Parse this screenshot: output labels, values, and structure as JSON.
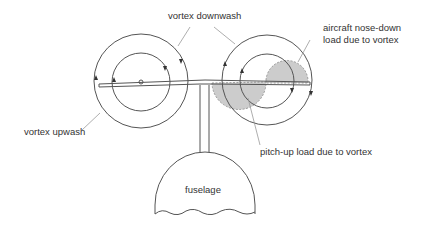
{
  "diagram": {
    "labels": {
      "vortex_downwash": "vortex downwash",
      "nose_down_line1": "aircraft nose-down",
      "nose_down_line2": "load due to vortex",
      "vortex_upwash": "vortex upwash",
      "pitch_up": "pitch-up load due to vortex",
      "fuselage": "fuselage"
    },
    "colors": {
      "stroke": "#555555",
      "leader": "#999999",
      "shade": "#cccccc",
      "text": "#333333"
    }
  }
}
